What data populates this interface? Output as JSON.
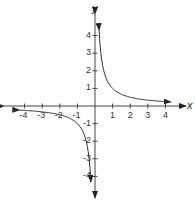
{
  "chart_data": {
    "type": "line",
    "title": "",
    "function": "y = 1/x",
    "xlabel": "x",
    "ylabel": "y",
    "xlim": [
      -4.3,
      4.3
    ],
    "ylim": [
      -4.3,
      4.3
    ],
    "grid": false,
    "x_ticks": [
      -4,
      -3,
      -2,
      -1,
      1,
      2,
      3,
      4
    ],
    "y_ticks": [
      -4,
      -3,
      -2,
      -1,
      1,
      2,
      3,
      4
    ],
    "x_tick_labels": [
      "-4",
      "-3",
      "-2",
      "-1",
      "1",
      "2",
      "3",
      "4"
    ],
    "y_tick_labels": [
      "4",
      "3",
      "2",
      "1",
      "-1",
      "-2",
      "-3",
      "-4"
    ],
    "series": [
      {
        "name": "right branch",
        "x": [
          0.23,
          0.25,
          0.3,
          0.4,
          0.5,
          0.75,
          1,
          1.5,
          2,
          3,
          4,
          4.3
        ],
        "y": [
          4.35,
          4,
          3.33,
          2.5,
          2,
          1.33,
          1,
          0.67,
          0.5,
          0.33,
          0.25,
          0.23
        ]
      },
      {
        "name": "left branch",
        "x": [
          -4.3,
          -4,
          -3,
          -2,
          -1.5,
          -1,
          -0.75,
          -0.5,
          -0.4,
          -0.3,
          -0.25,
          -0.23
        ],
        "y": [
          -0.23,
          -0.25,
          -0.33,
          -0.5,
          -0.67,
          -1,
          -1.33,
          -2,
          -2.5,
          -3.33,
          -4,
          -4.35
        ]
      }
    ]
  },
  "labels": {
    "x_axis": "x",
    "y_axis": "y"
  }
}
